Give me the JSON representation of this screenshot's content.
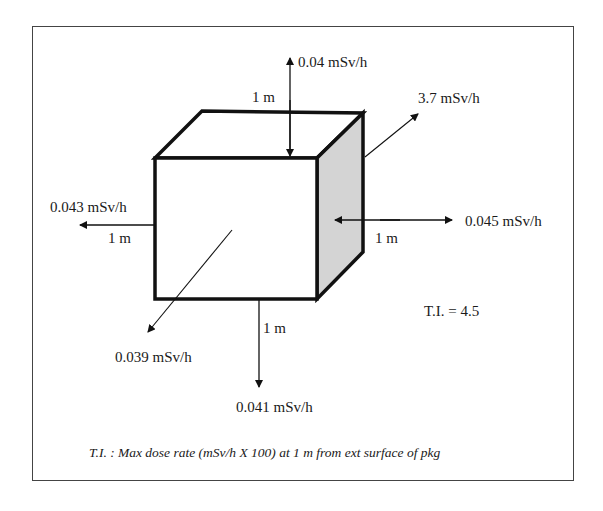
{
  "diagram": {
    "colors": {
      "side_face": "#d4d4d4",
      "outline": "#111111",
      "frame": "#444444"
    },
    "labels": {
      "top_rate": "0.04 mSv/h",
      "top_distance": "1 m",
      "corner_rate": "3.7 mSv/h",
      "left_rate": "0.043 mSv/h",
      "left_distance": "1 m",
      "right_rate": "0.045 mSv/h",
      "right_distance": "1 m",
      "front_rate": "0.039 mSv/h",
      "bottom_distance": "1 m",
      "bottom_rate": "0.041 mSv/h",
      "transport_index": "T.I. = 4.5",
      "caption": "T.I. : Max dose rate (mSv/h X 100) at 1 m from ext surface of pkg"
    }
  }
}
